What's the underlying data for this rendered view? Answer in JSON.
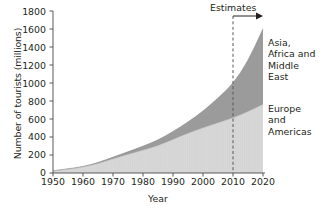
{
  "chart_data": {
    "type": "area",
    "stacked": true,
    "title": "",
    "xlabel": "Year",
    "ylabel": "Number of tourists (millions)",
    "xlim": [
      1950,
      2020
    ],
    "ylim": [
      0,
      1800
    ],
    "xticks": [
      1950,
      1960,
      1970,
      1980,
      1990,
      2000,
      2010,
      2020
    ],
    "yticks": [
      0,
      200,
      400,
      600,
      800,
      1000,
      1200,
      1400,
      1600,
      1800
    ],
    "grid": false,
    "legend_position": "inline-right",
    "x": [
      1950,
      1955,
      1960,
      1965,
      1970,
      1975,
      1980,
      1985,
      1990,
      1995,
      2000,
      2005,
      2010,
      2015,
      2020
    ],
    "series": [
      {
        "name": "Europe and Americas",
        "color": "#d9d9d9",
        "values": [
          24,
          42,
          62,
          102,
          155,
          205,
          252,
          300,
          370,
          440,
          500,
          555,
          610,
          680,
          760
        ]
      },
      {
        "name": "Asia, Africa and Middle East",
        "color": "#9b9b9b",
        "values": [
          1,
          4,
          8,
          13,
          20,
          30,
          45,
          65,
          90,
          125,
          185,
          275,
          380,
          560,
          840
        ]
      }
    ],
    "totals": [
      25,
      46,
      70,
      115,
      175,
      235,
      297,
      365,
      460,
      565,
      685,
      830,
      990,
      1240,
      1600
    ],
    "annotations": [
      {
        "name": "estimates",
        "label": "Estimates",
        "line_x": 2010,
        "line_style": "dashed",
        "arrow": "right"
      }
    ]
  },
  "labels": {
    "ylabel": "Number of tourists (millions)",
    "xlabel": "Year",
    "estimates": "Estimates",
    "series_top_line1": "Asia,",
    "series_top_line2": "Africa and",
    "series_top_line3": "Middle",
    "series_top_line4": "East",
    "series_bottom_line1": "Europe",
    "series_bottom_line2": "and",
    "series_bottom_line3": "Americas"
  },
  "yticks": {
    "t0": "0",
    "t1": "200",
    "t2": "400",
    "t3": "600",
    "t4": "800",
    "t5": "1000",
    "t6": "1200",
    "t7": "1400",
    "t8": "1600",
    "t9": "1800"
  },
  "xticks": {
    "t0": "1950",
    "t1": "1960",
    "t2": "1970",
    "t3": "1980",
    "t4": "1990",
    "t5": "2000",
    "t6": "2010",
    "t7": "2020"
  },
  "colors": {
    "series_bottom": "#d9d9d9",
    "series_top": "#9b9b9b",
    "axis": "#58595b",
    "text": "#231f20"
  }
}
